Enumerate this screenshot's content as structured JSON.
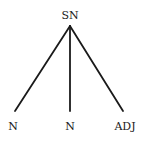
{
  "diagram": {
    "type": "syntax-tree",
    "root": {
      "label": "SN",
      "x": 70,
      "y": 10
    },
    "children": [
      {
        "label": "N",
        "x": 13,
        "y": 121
      },
      {
        "label": "N",
        "x": 70,
        "y": 121
      },
      {
        "label": "ADJ",
        "x": 125,
        "y": 121
      }
    ],
    "edges": [
      {
        "from": "SN",
        "to": "N (left)",
        "x1": 70,
        "y1": 26,
        "x2": 15,
        "y2": 111
      },
      {
        "from": "SN",
        "to": "N (middle)",
        "x1": 70,
        "y1": 26,
        "x2": 70,
        "y2": 111
      },
      {
        "from": "SN",
        "to": "ADJ",
        "x1": 70,
        "y1": 26,
        "x2": 123,
        "y2": 111
      }
    ],
    "colors": {
      "line": "#1a1a1a",
      "text": "#1a1a1a",
      "background": "#ffffff"
    }
  }
}
